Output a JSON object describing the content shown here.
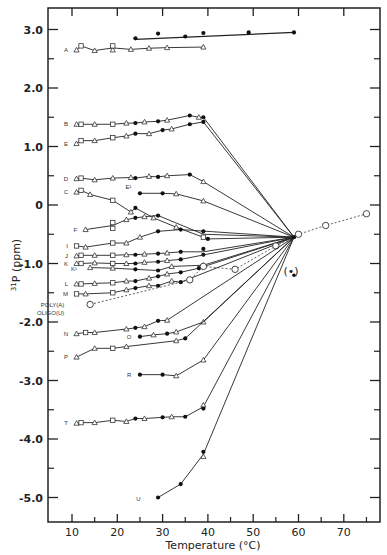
{
  "chart_data": {
    "type": "line",
    "title": "",
    "xlabel": "Temperature (°C)",
    "ylabel": "31P (ppm)",
    "ylabel_super": "31",
    "ylabel_main": "P (ppm)",
    "xlim": [
      5,
      78
    ],
    "ylim": [
      -5.4,
      3.3
    ],
    "x_ticks": [
      10,
      20,
      30,
      40,
      50,
      60,
      70
    ],
    "x_tick_labels": [
      "10",
      "20",
      "30",
      "40",
      "50",
      "60",
      "70"
    ],
    "x_minor_ticks": [
      15,
      25,
      35,
      45,
      55,
      65,
      75
    ],
    "y_ticks": [
      3.0,
      2.0,
      1.0,
      0,
      -1.0,
      -2.0,
      -3.0,
      -4.0,
      -5.0
    ],
    "y_tick_labels": [
      "3.0",
      "2.0",
      "1.0",
      "0",
      "-1.0",
      "-2.0",
      "-3.0",
      "-4.0",
      "-5.0"
    ],
    "y_minor_ticks": [
      2.5,
      1.5,
      0.5,
      -0.5,
      -1.5,
      -2.5,
      -3.5,
      -4.5
    ],
    "grid": false,
    "legend": "none (series labeled inline at left)",
    "convergence_point": {
      "x": 59,
      "y": -0.55
    },
    "annotation": {
      "text": "(•)",
      "x": 59,
      "y": -1.2
    },
    "series": [
      {
        "name": "A",
        "label_at": [
          10,
          2.65
        ],
        "triangles": [
          [
            11,
            2.65
          ],
          [
            15,
            2.64
          ],
          [
            19,
            2.65
          ],
          [
            23,
            2.66
          ],
          [
            27,
            2.68
          ],
          [
            31,
            2.69
          ],
          [
            39,
            2.7
          ]
        ],
        "squares": [
          [
            12,
            2.72
          ],
          [
            19,
            2.72
          ]
        ],
        "filled": []
      },
      {
        "name": "A (filled)",
        "label_at": null,
        "triangles": [],
        "squares": [],
        "filled": [
          [
            24,
            2.85
          ],
          [
            29,
            2.93
          ],
          [
            35,
            2.88
          ],
          [
            39,
            2.94
          ],
          [
            49,
            2.95
          ],
          [
            59,
            2.95
          ]
        ],
        "line": [
          [
            24,
            2.83
          ],
          [
            59,
            2.95
          ]
        ]
      },
      {
        "name": "B",
        "label_at": [
          10,
          1.38
        ],
        "triangles": [
          [
            11,
            1.38
          ],
          [
            15,
            1.38
          ],
          [
            22,
            1.4
          ],
          [
            26,
            1.42
          ],
          [
            31,
            1.45
          ],
          [
            38,
            1.5
          ]
        ],
        "squares": [
          [
            12,
            1.38
          ],
          [
            19,
            1.38
          ]
        ],
        "filled": [
          [
            24,
            1.4
          ],
          [
            29,
            1.43
          ],
          [
            36,
            1.53
          ],
          [
            39,
            1.5
          ]
        ],
        "to_converge": true
      },
      {
        "name": "E",
        "label_at": [
          10,
          1.05
        ],
        "triangles": [
          [
            11,
            1.05
          ],
          [
            15,
            1.1
          ],
          [
            22,
            1.18
          ],
          [
            27,
            1.22
          ],
          [
            32,
            1.3
          ]
        ],
        "squares": [
          [
            12,
            1.1
          ],
          [
            19,
            1.15
          ]
        ],
        "filled": [
          [
            24,
            1.22
          ],
          [
            30,
            1.28
          ],
          [
            36,
            1.38
          ],
          [
            39,
            1.42
          ]
        ],
        "to_converge": true
      },
      {
        "name": "D",
        "label_at": [
          10,
          0.45
        ],
        "triangles": [
          [
            11,
            0.45
          ],
          [
            15,
            0.43
          ],
          [
            19,
            0.46
          ],
          [
            23,
            0.47
          ],
          [
            27,
            0.49
          ],
          [
            31,
            0.5
          ],
          [
            39,
            0.4
          ]
        ],
        "squares": [
          [
            12,
            0.46
          ]
        ],
        "filled": [
          [
            24,
            0.46
          ],
          [
            29,
            0.48
          ],
          [
            36,
            0.52
          ]
        ],
        "to_converge": true
      },
      {
        "name": "C",
        "label_at": [
          10,
          0.22
        ],
        "triangles": [
          [
            11,
            0.22
          ],
          [
            14,
            0.18
          ],
          [
            23,
            -0.12
          ],
          [
            28,
            -0.22
          ],
          [
            33,
            -0.38
          ]
        ],
        "squares": [
          [
            12,
            0.25
          ],
          [
            19,
            0.08
          ]
        ],
        "filled": [
          [
            24,
            -0.05
          ],
          [
            40,
            -0.58
          ]
        ],
        "to_converge": true
      },
      {
        "name": "E¹",
        "label_at": [
          24,
          0.3
        ],
        "triangles": [
          [
            33,
            0.19
          ],
          [
            39,
            0.07
          ]
        ],
        "squares": [],
        "filled": [
          [
            25,
            0.2
          ],
          [
            30,
            0.2
          ]
        ],
        "to_converge": true
      },
      {
        "name": "F",
        "label_at": [
          12,
          -0.42
        ],
        "triangles": [
          [
            13,
            -0.42
          ],
          [
            22,
            -0.25
          ],
          [
            26,
            -0.2
          ]
        ],
        "squares": [
          [
            19,
            -0.3
          ],
          [
            19,
            -0.4
          ]
        ],
        "filled": [
          [
            24,
            -0.22
          ],
          [
            29,
            -0.18
          ],
          [
            39,
            -0.45
          ]
        ],
        "squares2": [
          [
            39,
            -0.55
          ]
        ],
        "to_converge": true
      },
      {
        "name": "I",
        "label_at": [
          10,
          -0.7
        ],
        "triangles": [
          [
            13,
            -0.72
          ],
          [
            22,
            -0.65
          ],
          [
            25,
            -0.55
          ]
        ],
        "squares": [
          [
            11,
            -0.7
          ],
          [
            19,
            -0.65
          ]
        ],
        "filled": [
          [
            29,
            -0.45
          ],
          [
            34,
            -0.42
          ]
        ],
        "to_converge": true
      },
      {
        "name": "J",
        "label_at": [
          10,
          -0.87
        ],
        "triangles": [
          [
            11,
            -0.87
          ],
          [
            15,
            -0.86
          ],
          [
            22,
            -0.85
          ],
          [
            26,
            -0.84
          ],
          [
            31,
            -0.82
          ]
        ],
        "squares": [
          [
            12,
            -0.86
          ],
          [
            19,
            -0.86
          ]
        ],
        "filled": [
          [
            24,
            -0.85
          ],
          [
            29,
            -0.83
          ],
          [
            34,
            -0.8
          ],
          [
            39,
            -0.75
          ],
          [
            39,
            -0.85
          ]
        ],
        "to_converge": true
      },
      {
        "name": "K",
        "label_at": [
          10,
          -1.0
        ],
        "triangles": [
          [
            11,
            -1.0
          ],
          [
            15,
            -0.99
          ],
          [
            22,
            -1.0
          ],
          [
            26,
            -0.98
          ],
          [
            31,
            -0.95
          ]
        ],
        "squares": [
          [
            12,
            -1.0
          ],
          [
            19,
            -1.0
          ]
        ],
        "filled": [
          [
            24,
            -1.0
          ],
          [
            29,
            -0.97
          ],
          [
            34,
            -0.93
          ]
        ],
        "to_converge": true
      },
      {
        "name": "K¹",
        "label_at": [
          12,
          -1.1
        ],
        "triangles": [
          [
            14,
            -1.07
          ],
          [
            19,
            -1.08
          ],
          [
            32,
            -1.05
          ],
          [
            39,
            -1.03
          ]
        ],
        "squares": [],
        "filled": [
          [
            24,
            -1.1
          ],
          [
            29,
            -1.12
          ]
        ],
        "to_converge": true
      },
      {
        "name": "L",
        "label_at": [
          10,
          -1.35
        ],
        "triangles": [
          [
            11,
            -1.35
          ],
          [
            15,
            -1.34
          ],
          [
            22,
            -1.3
          ],
          [
            27,
            -1.25
          ],
          [
            31,
            -1.18
          ]
        ],
        "squares": [
          [
            12,
            -1.35
          ],
          [
            19,
            -1.33
          ]
        ],
        "filled": [
          [
            24,
            -1.3
          ],
          [
            29,
            -1.22
          ],
          [
            34,
            -1.15
          ],
          [
            38,
            -1.08
          ]
        ],
        "to_converge": true
      },
      {
        "name": "M",
        "label_at": [
          10,
          -1.52
        ],
        "triangles": [
          [
            13,
            -1.52
          ],
          [
            22,
            -1.45
          ],
          [
            27,
            -1.38
          ],
          [
            32,
            -1.3
          ]
        ],
        "squares": [
          [
            11,
            -1.52
          ],
          [
            19,
            -1.5
          ]
        ],
        "filled": [
          [
            24,
            -1.42
          ],
          [
            29,
            -1.38
          ],
          [
            34,
            -1.32
          ]
        ],
        "to_converge": true
      },
      {
        "name": "POLY(A) OLIGO(U)",
        "label_at": [
          3,
          -1.85
        ],
        "dashed": true,
        "open_circles": [
          [
            14,
            -1.7
          ],
          [
            36,
            -1.28
          ],
          [
            39,
            -1.05
          ],
          [
            46,
            -1.1
          ],
          [
            55,
            -0.7
          ],
          [
            60,
            -0.5
          ],
          [
            66,
            -0.35
          ],
          [
            75,
            -0.15
          ]
        ]
      },
      {
        "name": "N",
        "label_at": [
          10,
          -2.2
        ],
        "triangles": [
          [
            11,
            -2.2
          ],
          [
            15,
            -2.18
          ],
          [
            22,
            -2.12
          ],
          [
            26,
            -2.08
          ],
          [
            31,
            -1.97
          ]
        ],
        "squares": [
          [
            13,
            -2.18
          ]
        ],
        "filled": [
          [
            24,
            -2.1
          ],
          [
            29,
            -1.98
          ]
        ],
        "to_converge": true
      },
      {
        "name": "O",
        "label_at": [
          24,
          -2.25
        ],
        "triangles": [
          [
            28,
            -2.22
          ],
          [
            33,
            -2.17
          ],
          [
            39,
            -2.0
          ]
        ],
        "squares": [],
        "filled": [
          [
            25,
            -2.25
          ],
          [
            31,
            -2.2
          ]
        ],
        "to_converge": true
      },
      {
        "name": "P",
        "label_at": [
          10,
          -2.6
        ],
        "triangles": [
          [
            11,
            -2.6
          ],
          [
            15,
            -2.45
          ],
          [
            22,
            -2.42
          ],
          [
            33,
            -2.32
          ]
        ],
        "squares": [
          [
            19,
            -2.45
          ]
        ],
        "filled": [
          [
            35,
            -2.28
          ]
        ],
        "to_converge": true
      },
      {
        "name": "R",
        "label_at": [
          24,
          -2.9
        ],
        "triangles": [
          [
            33,
            -2.92
          ],
          [
            39,
            -2.65
          ]
        ],
        "squares": [],
        "filled": [
          [
            25,
            -2.9
          ],
          [
            30,
            -2.9
          ]
        ],
        "to_converge": true
      },
      {
        "name": "T",
        "label_at": [
          10,
          -3.73
        ],
        "triangles": [
          [
            11,
            -3.73
          ],
          [
            15,
            -3.72
          ],
          [
            22,
            -3.7
          ],
          [
            26,
            -3.65
          ],
          [
            32,
            -3.62
          ],
          [
            39,
            -3.42
          ]
        ],
        "squares": [
          [
            12,
            -3.72
          ],
          [
            19,
            -3.68
          ]
        ],
        "filled": [
          [
            24,
            -3.65
          ],
          [
            30,
            -3.63
          ],
          [
            35,
            -3.62
          ],
          [
            39,
            -3.48
          ]
        ],
        "to_converge": true
      },
      {
        "name": "U",
        "label_at": [
          26,
          -5.02
        ],
        "triangles": [
          [
            39,
            -4.3
          ]
        ],
        "squares": [],
        "filled": [
          [
            29,
            -5.0
          ],
          [
            34,
            -4.77
          ],
          [
            39,
            -4.22
          ]
        ],
        "to_converge": true
      }
    ]
  }
}
